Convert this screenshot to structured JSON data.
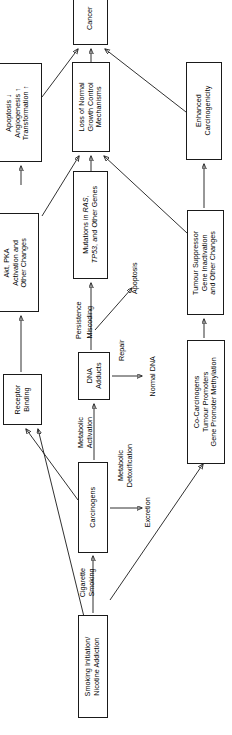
{
  "diagram": {
    "orientation": "rotated-90-ccw",
    "line_color": "#1a1a1a",
    "background": "#ffffff",
    "nodes": [
      {
        "id": "cancer",
        "label": "Cancer"
      },
      {
        "id": "apoptosis_ang",
        "label": "Apoptosis ↓\nAngiogenesis ↑\nTransformation ↑"
      },
      {
        "id": "loss_growth",
        "label": "Loss of Normal\nGrowth Control\nMechanisms"
      },
      {
        "id": "enhanced_carc",
        "label": "Enhanced\nCarcinogenicity"
      },
      {
        "id": "akt_pka",
        "label": "Akt, PKA\nActivation and\nOther Changes"
      },
      {
        "id": "mutations",
        "label_parts": [
          "Mutations in ",
          "RAS",
          ",",
          "TP53",
          ", and Other Genes"
        ],
        "label": "Mutations in RAS, TP53, and Other Genes"
      },
      {
        "id": "tumour_supp",
        "label": "Tumour Suppressor\nGene Inactivation\nand Other Changes"
      },
      {
        "id": "receptor",
        "label": "Receptor\nBinding"
      },
      {
        "id": "dna_adducts",
        "label": "DNA\nAdducts"
      },
      {
        "id": "co_carcinogens",
        "label": "Co-Carcinogens\nTumour Promoters\nGene Promoter Methylation"
      },
      {
        "id": "carcinogens",
        "label": "Carcinogens"
      },
      {
        "id": "smoking_init",
        "label": "Smoking Initiation/\nNicotine Addiction"
      }
    ],
    "edge_labels": [
      {
        "id": "persistence",
        "label": "Persistence"
      },
      {
        "id": "miscoding",
        "label": "Miscoding"
      },
      {
        "id": "apoptosis_out",
        "label": "Apoptosis"
      },
      {
        "id": "repair",
        "label": "Repair"
      },
      {
        "id": "normal_dna",
        "label": "Normal DNA"
      },
      {
        "id": "met_activation",
        "label": "Metabolic\nActivation"
      },
      {
        "id": "met_detox",
        "label": "Metabolic\nDetoxification"
      },
      {
        "id": "excretion",
        "label": "Excretion"
      },
      {
        "id": "cig_smoking",
        "label": "Cigarette\nSmoking"
      }
    ]
  }
}
